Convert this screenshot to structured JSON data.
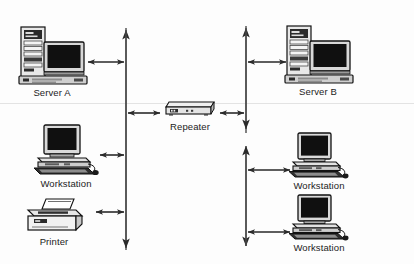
{
  "diagram": {
    "type": "network-topology",
    "width": 414,
    "height": 264,
    "background_color": "#fdfdfd",
    "line_color": "#2b2b2b"
  },
  "segments": [
    {
      "name": "left-segment",
      "bus_x": 126,
      "bus_top": 28,
      "bus_bottom": 250,
      "top_arrow": "up",
      "bottom_arrow": "down"
    },
    {
      "name": "right-segment",
      "bus_x": 246,
      "bus_top": 26,
      "bus_bottom": 248,
      "top_arrow": "up",
      "bottom_arrow": "down",
      "break_top_y": 131,
      "break_bottom_y": 146
    }
  ],
  "nodes": [
    {
      "id": "server-a",
      "label": "Server A",
      "icon": "server-tower-icon",
      "segment": "left-segment",
      "x": 14,
      "y": 25,
      "icon_width": 76,
      "icon_height": 62,
      "link_y": 62,
      "link_from": 84,
      "link_to": 126
    },
    {
      "id": "workstation-left",
      "label": "Workstation",
      "icon": "workstation-desktop-icon",
      "segment": "left-segment",
      "x": 30,
      "y": 124,
      "icon_width": 72,
      "icon_height": 54,
      "link_y": 155,
      "link_from": 98,
      "link_to": 126
    },
    {
      "id": "printer",
      "label": "Printer",
      "icon": "printer-icon",
      "segment": "left-segment",
      "x": 18,
      "y": 198,
      "icon_width": 72,
      "icon_height": 38,
      "link_y": 212,
      "link_from": 94,
      "link_to": 126
    },
    {
      "id": "repeater",
      "label": "Repeater",
      "icon": "repeater-box-icon",
      "segment": "both",
      "x": 162,
      "y": 100,
      "icon_width": 56,
      "icon_height": 20,
      "link_y": 113,
      "link_left_from": 126,
      "link_left_to": 162,
      "link_right_from": 218,
      "link_right_to": 246
    },
    {
      "id": "server-b",
      "label": "Server B",
      "icon": "server-tower-icon",
      "segment": "right-segment",
      "x": 280,
      "y": 24,
      "icon_width": 76,
      "icon_height": 62,
      "link_y": 62,
      "link_from": 246,
      "link_to": 288
    },
    {
      "id": "workstation-right-top",
      "label": "Workstation",
      "icon": "workstation-desktop-icon",
      "segment": "right-segment",
      "x": 286,
      "y": 132,
      "icon_width": 66,
      "icon_height": 48,
      "link_y": 170,
      "link_from": 246,
      "link_to": 292
    },
    {
      "id": "workstation-right-bottom",
      "label": "Workstation",
      "icon": "workstation-desktop-icon",
      "segment": "right-segment",
      "x": 286,
      "y": 194,
      "icon_width": 66,
      "icon_height": 48,
      "link_y": 232,
      "link_from": 246,
      "link_to": 292
    }
  ]
}
